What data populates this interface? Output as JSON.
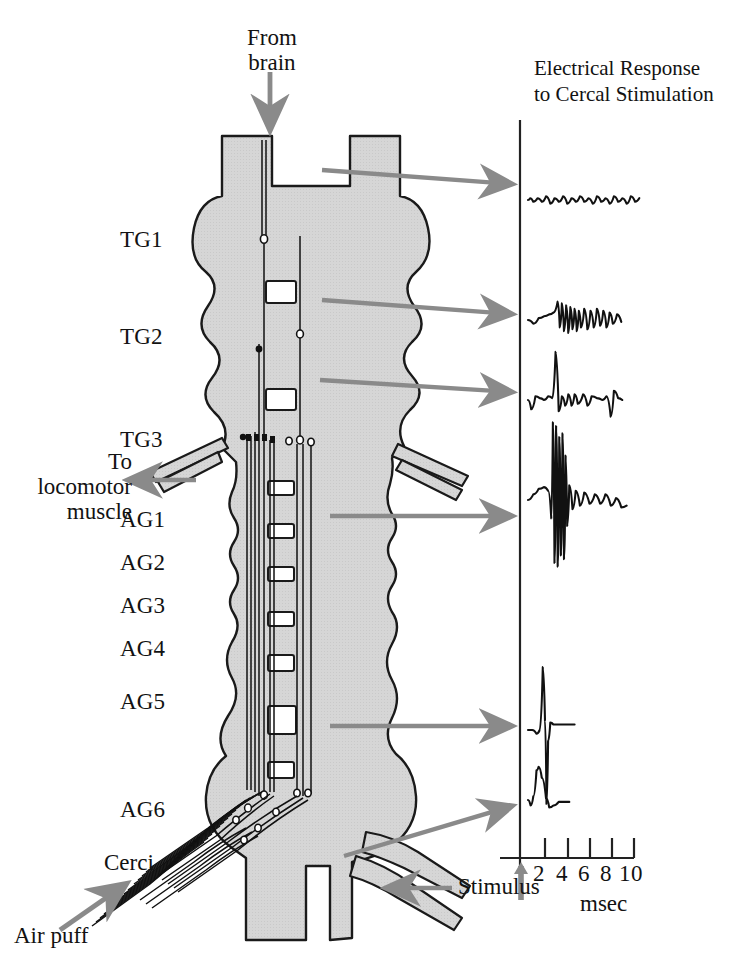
{
  "figure": {
    "title_line1": "Electrical Response",
    "title_line2": "to Cercal Stimulation",
    "background": "#ffffff",
    "cord_fill": "#d4d4d4",
    "cord_stroke": "#1a1a1a",
    "arrow_color": "#8a8a8a",
    "trace_color": "#111111",
    "axis_color": "#222222"
  },
  "callouts": {
    "from_brain_line1": "From",
    "from_brain_line2": "brain",
    "to_muscle_line1": "To",
    "to_muscle_line2": "locomotor",
    "to_muscle_line3": "muscle",
    "cerci": "Cerci",
    "air_puff": "Air puff",
    "stimulus": "Stimulus"
  },
  "segments": [
    {
      "id": "TG1",
      "label": "TG1",
      "x": 120,
      "y": 228
    },
    {
      "id": "TG2",
      "label": "TG2",
      "x": 120,
      "y": 325
    },
    {
      "id": "TG3",
      "label": "TG3",
      "x": 120,
      "y": 428
    },
    {
      "id": "AG1",
      "label": "AG1",
      "x": 120,
      "y": 508
    },
    {
      "id": "AG2",
      "label": "AG2",
      "x": 120,
      "y": 551
    },
    {
      "id": "AG3",
      "label": "AG3",
      "x": 120,
      "y": 594
    },
    {
      "id": "AG4",
      "label": "AG4",
      "x": 120,
      "y": 637
    },
    {
      "id": "AG5",
      "label": "AG5",
      "x": 120,
      "y": 690
    },
    {
      "id": "AG6",
      "label": "AG6",
      "x": 120,
      "y": 798
    }
  ],
  "chart_data": {
    "type": "line",
    "xlabel": "msec",
    "ylabel": "",
    "xlim": [
      0,
      11
    ],
    "xticks": [
      2,
      4,
      6,
      8,
      10
    ],
    "xtick_labels": [
      "2",
      "4",
      "6",
      "8",
      "10"
    ],
    "grid": false,
    "legend": false,
    "stimulus_marker_at": 0,
    "axis_origin_x": 520,
    "axis_top_y": 120,
    "axis_bottom_y": 858,
    "series": [
      {
        "name": "TG1 recording",
        "source_segment": "TG1",
        "baseline_y": 200,
        "description": "flat baseline with low-amplitude noise, no evoked response",
        "points": [
          [
            0,
            0
          ],
          [
            0.2,
            1
          ],
          [
            0.5,
            -1
          ],
          [
            0.9,
            1
          ],
          [
            1.3,
            -1
          ],
          [
            1.7,
            2
          ],
          [
            2.1,
            -2
          ],
          [
            2.5,
            1
          ],
          [
            2.9,
            -1
          ],
          [
            3.3,
            2
          ],
          [
            3.7,
            -2
          ],
          [
            4.1,
            1
          ],
          [
            4.5,
            -1
          ],
          [
            4.9,
            2
          ],
          [
            5.3,
            -1
          ],
          [
            5.7,
            1
          ],
          [
            6.1,
            -2
          ],
          [
            6.5,
            2
          ],
          [
            6.9,
            -1
          ],
          [
            7.3,
            1
          ],
          [
            7.7,
            -2
          ],
          [
            8.1,
            2
          ],
          [
            8.5,
            -1
          ],
          [
            8.9,
            1
          ],
          [
            9.3,
            -2
          ],
          [
            9.7,
            2
          ],
          [
            10.1,
            -1
          ],
          [
            10.5,
            1
          ]
        ]
      },
      {
        "name": "TG2 recording",
        "source_segment": "TG2",
        "baseline_y": 320,
        "description": "slow rise then medium-amplitude oscillating burst",
        "points": [
          [
            0,
            0
          ],
          [
            0.5,
            -2
          ],
          [
            1.0,
            1
          ],
          [
            1.5,
            2
          ],
          [
            2.0,
            3
          ],
          [
            2.4,
            4
          ],
          [
            2.8,
            10
          ],
          [
            3.0,
            -4
          ],
          [
            3.2,
            9
          ],
          [
            3.4,
            -6
          ],
          [
            3.6,
            8
          ],
          [
            3.8,
            -7
          ],
          [
            4.0,
            7
          ],
          [
            4.2,
            -5
          ],
          [
            4.4,
            6
          ],
          [
            4.6,
            -6
          ],
          [
            4.8,
            5
          ],
          [
            5.0,
            -4
          ],
          [
            5.3,
            6
          ],
          [
            5.6,
            -5
          ],
          [
            5.9,
            5
          ],
          [
            6.2,
            -4
          ],
          [
            6.5,
            6
          ],
          [
            6.8,
            -3
          ],
          [
            7.1,
            5
          ],
          [
            7.4,
            -4
          ],
          [
            7.7,
            4
          ],
          [
            8.0,
            -2
          ],
          [
            8.4,
            3
          ],
          [
            8.8,
            -1
          ]
        ]
      },
      {
        "name": "TG3 recording",
        "source_segment": "TG3",
        "baseline_y": 400,
        "description": "single prominent spike followed by small ripples",
        "points": [
          [
            0,
            0
          ],
          [
            0.3,
            -5
          ],
          [
            0.7,
            2
          ],
          [
            1.1,
            1
          ],
          [
            1.5,
            0
          ],
          [
            1.9,
            2
          ],
          [
            2.3,
            1
          ],
          [
            2.6,
            26
          ],
          [
            2.9,
            -6
          ],
          [
            3.2,
            2
          ],
          [
            3.5,
            -3
          ],
          [
            3.8,
            3
          ],
          [
            4.1,
            -3
          ],
          [
            4.4,
            3
          ],
          [
            4.7,
            -2
          ],
          [
            5.2,
            3
          ],
          [
            5.6,
            -3
          ],
          [
            6.0,
            2
          ],
          [
            6.5,
            1
          ],
          [
            7.0,
            0
          ],
          [
            7.4,
            2
          ],
          [
            7.8,
            -9
          ],
          [
            8.1,
            5
          ],
          [
            8.5,
            1
          ],
          [
            8.9,
            0
          ]
        ]
      },
      {
        "name": "AG1 recording",
        "source_segment": "AG1",
        "baseline_y": 500,
        "description": "large high-frequency spike burst, strongest evoked response",
        "points": [
          [
            0,
            0
          ],
          [
            0.5,
            3
          ],
          [
            1.0,
            6
          ],
          [
            1.5,
            7
          ],
          [
            1.9,
            5
          ],
          [
            2.2,
            -10
          ],
          [
            2.35,
            42
          ],
          [
            2.5,
            -34
          ],
          [
            2.65,
            40
          ],
          [
            2.8,
            -36
          ],
          [
            2.95,
            34
          ],
          [
            3.1,
            -30
          ],
          [
            3.25,
            36
          ],
          [
            3.4,
            -32
          ],
          [
            3.55,
            24
          ],
          [
            3.7,
            -14
          ],
          [
            3.9,
            8
          ],
          [
            4.2,
            -5
          ],
          [
            4.5,
            5
          ],
          [
            4.9,
            -3
          ],
          [
            5.3,
            4
          ],
          [
            5.8,
            -2
          ],
          [
            6.3,
            3
          ],
          [
            6.8,
            -2
          ],
          [
            7.3,
            3
          ],
          [
            7.8,
            -3
          ],
          [
            8.3,
            1
          ],
          [
            8.8,
            -4
          ],
          [
            9.3,
            -3
          ]
        ]
      },
      {
        "name": "AG5 recording",
        "source_segment": "AG5",
        "baseline_y": 730,
        "description": "single large biphasic spike, positive then negative",
        "points": [
          [
            0,
            0
          ],
          [
            0.4,
            0
          ],
          [
            0.8,
            -2
          ],
          [
            1.1,
            0
          ],
          [
            1.4,
            34
          ],
          [
            1.6,
            5
          ],
          [
            1.75,
            -40
          ],
          [
            1.9,
            -6
          ],
          [
            2.1,
            4
          ],
          [
            2.4,
            3
          ],
          [
            2.9,
            3
          ],
          [
            3.4,
            3
          ],
          [
            3.9,
            3
          ],
          [
            4.4,
            3
          ]
        ]
      },
      {
        "name": "AG6 recording",
        "source_segment": "AG6",
        "baseline_y": 800,
        "description": "single rounded positive deflection, earliest response",
        "points": [
          [
            0,
            0
          ],
          [
            0.25,
            -3
          ],
          [
            0.5,
            2
          ],
          [
            0.8,
            16
          ],
          [
            1.0,
            18
          ],
          [
            1.3,
            12
          ],
          [
            1.7,
            1
          ],
          [
            2.0,
            -4
          ],
          [
            2.4,
            -3
          ],
          [
            2.9,
            -1
          ],
          [
            3.4,
            -1
          ],
          [
            3.9,
            -1
          ]
        ]
      }
    ]
  }
}
